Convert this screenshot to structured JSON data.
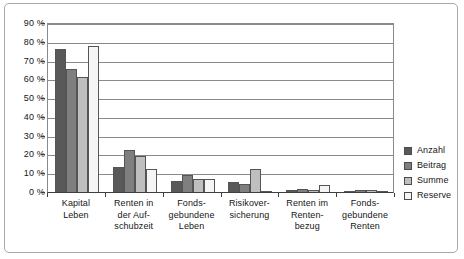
{
  "chart_data": {
    "type": "bar",
    "title": "",
    "subtitle": "",
    "xlabel": "",
    "ylabel": "",
    "ylim": [
      0,
      90
    ],
    "ytick_step": 10,
    "ytick_labels": [
      "90 %",
      "80 %",
      "70 %",
      "60 %",
      "50 %",
      "40 %",
      "30 %",
      "20 %",
      "10 %",
      "0 %"
    ],
    "ytick_values": [
      90,
      80,
      70,
      60,
      50,
      40,
      30,
      20,
      10,
      0
    ],
    "grid": true,
    "legend_position": "right",
    "categories": [
      "Kapital Leben",
      "Renten in der Auf-schubzeit",
      "Fonds-gebundene Leben",
      "Risikover-sicherung",
      "Renten im Renten-bezug",
      "Fonds-gebundene Renten"
    ],
    "category_lines": [
      [
        "Kapital",
        "Leben"
      ],
      [
        "Renten in",
        "der Auf-",
        "schubzeit"
      ],
      [
        "Fonds-",
        "gebundene",
        "Leben"
      ],
      [
        "Risikover-",
        "sicherung"
      ],
      [
        "Renten im",
        "Renten-",
        "bezug"
      ],
      [
        "Fonds-",
        "gebundene",
        "Renten"
      ]
    ],
    "series": [
      {
        "name": "Anzahl",
        "color": "#595959",
        "values": [
          76.0,
          13.2,
          6.1,
          5.6,
          1.2,
          0.6
        ]
      },
      {
        "name": "Beitrag",
        "color": "#7f7f7f",
        "values": [
          65.5,
          22.2,
          8.8,
          4.1,
          1.8,
          0.9
        ]
      },
      {
        "name": "Summe",
        "color": "#bfbfbf",
        "values": [
          61.0,
          19.3,
          7.0,
          12.4,
          1.0,
          0.9
        ]
      },
      {
        "name": "Reserve",
        "color": "#f5f5f5",
        "values": [
          78.0,
          12.1,
          7.1,
          0.4,
          3.7,
          0.8
        ]
      }
    ]
  }
}
